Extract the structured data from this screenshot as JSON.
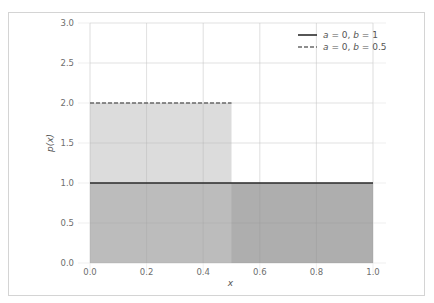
{
  "chart_data": {
    "type": "area",
    "title": "",
    "xlabel": "x",
    "ylabel": "p(x)",
    "xlim": [
      0.0,
      1.0
    ],
    "ylim": [
      0.0,
      3.0
    ],
    "xticks": [
      "0.0",
      "0.2",
      "0.4",
      "0.6",
      "0.8",
      "1.0"
    ],
    "yticks": [
      "0.0",
      "0.5",
      "1.0",
      "1.5",
      "2.0",
      "2.5",
      "3.0"
    ],
    "xtick_values": [
      0.0,
      0.2,
      0.4,
      0.6,
      0.8,
      1.0
    ],
    "ytick_values": [
      0.0,
      0.5,
      1.0,
      1.5,
      2.0,
      2.5,
      3.0
    ],
    "grid": true,
    "legend_position": "top-right",
    "series": [
      {
        "name": "a = 0, b = 1",
        "label_parts": [
          "a",
          " = 0, ",
          "b",
          " = 1"
        ],
        "a": 0,
        "b": 1,
        "x": [
          0.0,
          1.0
        ],
        "y": [
          1.0,
          1.0
        ],
        "line_style": "solid",
        "line_color": "#2b2b2b",
        "fill_color": "#9a9a9a",
        "fill_opacity": 0.8
      },
      {
        "name": "a = 0, b = 0.5",
        "label_parts": [
          "a",
          " = 0, ",
          "b",
          " = 0.5"
        ],
        "a": 0,
        "b": 0.5,
        "x": [
          0.0,
          0.5
        ],
        "y": [
          2.0,
          2.0
        ],
        "line_style": "dashed",
        "line_color": "#6a6a6a",
        "fill_color": "#c4c4c4",
        "fill_opacity": 0.6
      }
    ]
  }
}
